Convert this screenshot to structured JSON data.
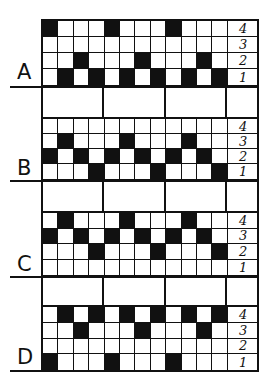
{
  "diagram": {
    "row_labels": [
      "4",
      "3",
      "2",
      "1"
    ],
    "blocks": [
      {
        "letter": "A",
        "rows": {
          "4": [
            1,
            0,
            0,
            0,
            1,
            0,
            0,
            0,
            1,
            0,
            0,
            0
          ],
          "3": [
            0,
            0,
            0,
            0,
            0,
            0,
            0,
            0,
            0,
            0,
            0,
            0
          ],
          "2": [
            0,
            0,
            1,
            0,
            0,
            0,
            1,
            0,
            0,
            0,
            1,
            0
          ],
          "1": [
            0,
            1,
            0,
            1,
            0,
            1,
            0,
            1,
            0,
            1,
            0,
            1
          ]
        }
      },
      {
        "letter": "B",
        "rows": {
          "4": [
            0,
            0,
            0,
            0,
            0,
            0,
            0,
            0,
            0,
            0,
            0,
            0
          ],
          "3": [
            0,
            1,
            0,
            0,
            0,
            1,
            0,
            0,
            0,
            1,
            0,
            0
          ],
          "2": [
            1,
            0,
            1,
            0,
            1,
            0,
            1,
            0,
            1,
            0,
            1,
            0
          ],
          "1": [
            0,
            0,
            0,
            1,
            0,
            0,
            0,
            1,
            0,
            0,
            0,
            1
          ]
        }
      },
      {
        "letter": "C",
        "rows": {
          "4": [
            0,
            1,
            0,
            0,
            0,
            1,
            0,
            0,
            0,
            1,
            0,
            0
          ],
          "3": [
            1,
            0,
            1,
            0,
            1,
            0,
            1,
            0,
            1,
            0,
            1,
            0
          ],
          "2": [
            0,
            0,
            0,
            1,
            0,
            0,
            0,
            1,
            0,
            0,
            0,
            1
          ],
          "1": [
            0,
            0,
            0,
            0,
            0,
            0,
            0,
            0,
            0,
            0,
            0,
            0
          ]
        }
      },
      {
        "letter": "D",
        "rows": {
          "4": [
            0,
            1,
            0,
            1,
            0,
            1,
            0,
            1,
            0,
            1,
            0,
            1
          ],
          "3": [
            0,
            0,
            1,
            0,
            0,
            0,
            1,
            0,
            0,
            0,
            1,
            0
          ],
          "2": [
            0,
            0,
            0,
            0,
            0,
            0,
            0,
            0,
            0,
            0,
            0,
            0
          ],
          "1": [
            1,
            0,
            0,
            0,
            1,
            0,
            0,
            0,
            1,
            0,
            0,
            0
          ]
        }
      }
    ]
  },
  "colors": {
    "ink": "#111111",
    "paper": "#ffffff"
  }
}
